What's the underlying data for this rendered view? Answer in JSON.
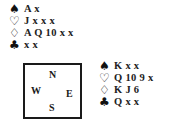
{
  "north": {
    "rows": [
      {
        "suit": "spades",
        "symbol": "♠",
        "cards": "A x"
      },
      {
        "suit": "hearts",
        "symbol": "♡",
        "cards": "J x x x"
      },
      {
        "suit": "diamonds",
        "symbol": "♢",
        "cards": "A Q 10 x x"
      },
      {
        "suit": "clubs",
        "symbol": "♣",
        "cards": "x x"
      }
    ]
  },
  "compass": {
    "n": "N",
    "w": "W",
    "e": "E",
    "s": "S"
  },
  "south_east": {
    "rows": [
      {
        "suit": "spades",
        "symbol": "♠",
        "cards": "K x x"
      },
      {
        "suit": "hearts",
        "symbol": "♡",
        "cards": "Q 10 9 x"
      },
      {
        "suit": "diamonds",
        "symbol": "♢",
        "cards": "K J 6"
      },
      {
        "suit": "clubs",
        "symbol": "♣",
        "cards": "Q x x"
      }
    ]
  }
}
